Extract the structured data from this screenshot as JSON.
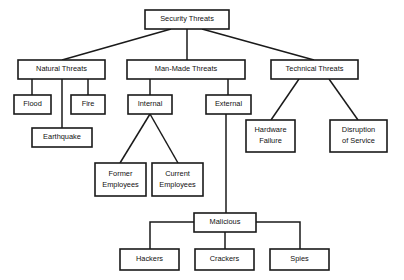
{
  "diagram": {
    "title": "Security Threats",
    "type": "tree-hierarchy",
    "nodes": [
      {
        "id": "security-threats",
        "label": "Security Threats",
        "lines": [
          "Security Threats"
        ],
        "x": 145,
        "y": 10,
        "w": 84,
        "h": 19,
        "level": 0
      },
      {
        "id": "natural-threats",
        "label": "Natural Threats",
        "lines": [
          "Natural Threats"
        ],
        "x": 18,
        "y": 60,
        "w": 87,
        "h": 19,
        "level": 1
      },
      {
        "id": "man-made-threats",
        "label": "Man-Made Threats",
        "lines": [
          "Man-Made Threats"
        ],
        "x": 127,
        "y": 60,
        "w": 118,
        "h": 19,
        "level": 1
      },
      {
        "id": "technical-threats",
        "label": "Technical Threats",
        "lines": [
          "Technical Threats"
        ],
        "x": 271,
        "y": 60,
        "w": 87,
        "h": 19,
        "level": 1
      },
      {
        "id": "flood",
        "label": "Flood",
        "lines": [
          "Flood"
        ],
        "x": 14,
        "y": 95,
        "w": 37,
        "h": 19,
        "level": 2
      },
      {
        "id": "fire",
        "label": "Fire",
        "lines": [
          "Fire"
        ],
        "x": 71,
        "y": 95,
        "w": 34,
        "h": 19,
        "level": 2
      },
      {
        "id": "internal",
        "label": "Internal",
        "lines": [
          "Internal"
        ],
        "x": 128,
        "y": 95,
        "w": 44,
        "h": 19,
        "level": 2
      },
      {
        "id": "external",
        "label": "External",
        "lines": [
          "External"
        ],
        "x": 206,
        "y": 95,
        "w": 45,
        "h": 19,
        "level": 2
      },
      {
        "id": "earthquake",
        "label": "Earthquake",
        "lines": [
          "Earthquake"
        ],
        "x": 32,
        "y": 128,
        "w": 60,
        "h": 19,
        "level": 3
      },
      {
        "id": "hardware-failure",
        "label": "Hardware Failure",
        "lines": [
          "Hardware",
          "Failure"
        ],
        "x": 246,
        "y": 120,
        "w": 49,
        "h": 32,
        "level": 2
      },
      {
        "id": "disruption-of-service",
        "label": "Disruption of Service",
        "lines": [
          "Disruption",
          "of Service"
        ],
        "x": 330,
        "y": 120,
        "w": 57,
        "h": 32,
        "level": 2
      },
      {
        "id": "former-employees",
        "label": "Former Employees",
        "lines": [
          "Former",
          "Employees"
        ],
        "x": 95,
        "y": 163,
        "w": 51,
        "h": 33,
        "level": 3
      },
      {
        "id": "current-employees",
        "label": "Current Employees",
        "lines": [
          "Current",
          "Employees"
        ],
        "x": 152,
        "y": 163,
        "w": 51,
        "h": 33,
        "level": 3
      },
      {
        "id": "malicious",
        "label": "Malicious",
        "lines": [
          "Malicious"
        ],
        "x": 194,
        "y": 213,
        "w": 62,
        "h": 19,
        "level": 3
      },
      {
        "id": "hackers",
        "label": "Hackers",
        "lines": [
          "Hackers"
        ],
        "x": 120,
        "y": 249,
        "w": 59,
        "h": 21,
        "level": 4
      },
      {
        "id": "crackers",
        "label": "Crackers",
        "lines": [
          "Crackers"
        ],
        "x": 195,
        "y": 249,
        "w": 59,
        "h": 21,
        "level": 4
      },
      {
        "id": "spies",
        "label": "Spies",
        "lines": [
          "Spies"
        ],
        "x": 270,
        "y": 249,
        "w": 59,
        "h": 21,
        "level": 4
      }
    ],
    "edges": [
      {
        "id": "edge-security-natural",
        "from": "security-threats",
        "to": "natural-threats",
        "points": "171,29 62,60"
      },
      {
        "id": "edge-security-manmade",
        "from": "security-threats",
        "to": "man-made-threats",
        "points": "187,29 187,60"
      },
      {
        "id": "edge-security-technical",
        "from": "security-threats",
        "to": "technical-threats",
        "points": "202,29 314,60"
      },
      {
        "id": "edge-natural-flood",
        "from": "natural-threats",
        "to": "flood",
        "points": "32,79 32,95"
      },
      {
        "id": "edge-natural-earthquake",
        "from": "natural-threats",
        "to": "earthquake",
        "points": "62,79 62,128"
      },
      {
        "id": "edge-natural-fire",
        "from": "natural-threats",
        "to": "fire",
        "points": "88,79 88,95"
      },
      {
        "id": "edge-manmade-internal",
        "from": "man-made-threats",
        "to": "internal",
        "points": "150,79 150,95"
      },
      {
        "id": "edge-manmade-external",
        "from": "man-made-threats",
        "to": "external",
        "points": "228,79 228,95"
      },
      {
        "id": "edge-internal-former",
        "from": "internal",
        "to": "former-employees",
        "points": "150,114 120,163"
      },
      {
        "id": "edge-internal-current",
        "from": "internal",
        "to": "current-employees",
        "points": "150,114 178,163"
      },
      {
        "id": "edge-external-malicious",
        "from": "external",
        "to": "malicious",
        "points": "226,114 226,213"
      },
      {
        "id": "edge-technical-hardware",
        "from": "technical-threats",
        "to": "hardware-failure",
        "points": "299,79 271,120"
      },
      {
        "id": "edge-technical-disruption",
        "from": "technical-threats",
        "to": "disruption-of-service",
        "points": "329,79 358,120"
      },
      {
        "id": "edge-malicious-hackers",
        "from": "malicious",
        "to": "hackers",
        "points": "194,222 150,222 150,249"
      },
      {
        "id": "edge-malicious-crackers",
        "from": "malicious",
        "to": "crackers",
        "points": "225,232 225,249"
      },
      {
        "id": "edge-malicious-spies",
        "from": "malicious",
        "to": "spies",
        "points": "256,222 300,222 300,249"
      }
    ]
  }
}
